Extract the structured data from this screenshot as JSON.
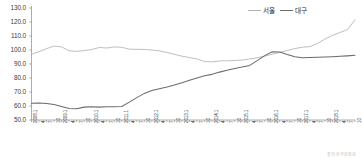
{
  "chart_data": {
    "type": "line",
    "title": "",
    "subtitle": "",
    "xlabel": "",
    "ylabel": "",
    "ylim": [
      50.0,
      130.0
    ],
    "ytick_step": 10.0,
    "ytick_labels": [
      "130.0",
      "120.0",
      "110.0",
      "100.0",
      "90.0",
      "80.0",
      "70.0",
      "60.0",
      "50.0"
    ],
    "grid": false,
    "legend_position": "top-right",
    "x_tick_labels": [
      "2008.1",
      "4",
      "7",
      "10",
      "2009.1",
      "4",
      "7",
      "10",
      "2010.1",
      "4",
      "7",
      "10",
      "2011.1",
      "4",
      "7",
      "10",
      "2012.1",
      "4",
      "7",
      "10",
      "2013.1",
      "4",
      "7",
      "10",
      "2014.1",
      "4",
      "7",
      "10",
      "2015.1",
      "4",
      "7",
      "10",
      "2016.1",
      "4",
      "7",
      "10",
      "2017.1",
      "4",
      "7",
      "10",
      "2018.1",
      "4",
      "7",
      "10"
    ],
    "x": [
      "2008.1",
      "2008.4",
      "2008.7",
      "2008.10",
      "2009.1",
      "2009.4",
      "2009.7",
      "2009.10",
      "2010.1",
      "2010.4",
      "2010.7",
      "2010.10",
      "2011.1",
      "2011.4",
      "2011.7",
      "2011.10",
      "2012.1",
      "2012.4",
      "2012.7",
      "2012.10",
      "2013.1",
      "2013.4",
      "2013.7",
      "2013.10",
      "2014.1",
      "2014.4",
      "2014.7",
      "2014.10",
      "2015.1",
      "2015.4",
      "2015.7",
      "2015.10",
      "2016.1",
      "2016.4",
      "2016.7",
      "2016.10",
      "2017.1",
      "2017.4",
      "2017.7",
      "2017.10",
      "2018.1",
      "2018.4",
      "2018.7",
      "2018.10"
    ],
    "series": [
      {
        "name": "서울",
        "color": "#b3b3b3",
        "values": [
          97.0,
          98.8,
          101.0,
          102.8,
          102.2,
          99.4,
          99.0,
          99.6,
          100.3,
          101.8,
          101.4,
          102.2,
          101.9,
          100.6,
          100.5,
          100.4,
          100.0,
          99.4,
          98.2,
          96.9,
          95.6,
          94.6,
          93.6,
          91.8,
          91.5,
          92.2,
          92.3,
          92.5,
          92.8,
          93.6,
          94.5,
          95.6,
          97.0,
          98.3,
          99.6,
          101.0,
          102.0,
          102.4,
          104.6,
          107.8,
          110.4,
          112.5,
          114.6,
          121.6
        ]
      },
      {
        "name": "대구",
        "color": "#6b6b6b",
        "values": [
          62.0,
          62.2,
          61.8,
          61.0,
          59.6,
          58.2,
          58.0,
          59.2,
          59.4,
          59.2,
          59.4,
          59.5,
          59.6,
          62.8,
          66.0,
          69.0,
          71.0,
          72.4,
          73.6,
          75.0,
          76.6,
          78.4,
          80.0,
          81.6,
          82.6,
          84.2,
          85.6,
          86.8,
          87.8,
          89.0,
          92.4,
          96.0,
          98.8,
          98.6,
          96.8,
          95.2,
          94.4,
          94.6,
          94.8,
          95.0,
          95.2,
          95.5,
          95.8,
          96.2
        ]
      }
    ]
  },
  "legend": {
    "items": [
      {
        "label": "서울",
        "color": "#b3b3b3"
      },
      {
        "label": "대구",
        "color": "#6b6b6b"
      }
    ]
  },
  "source_note": "출처: 한국감정원"
}
